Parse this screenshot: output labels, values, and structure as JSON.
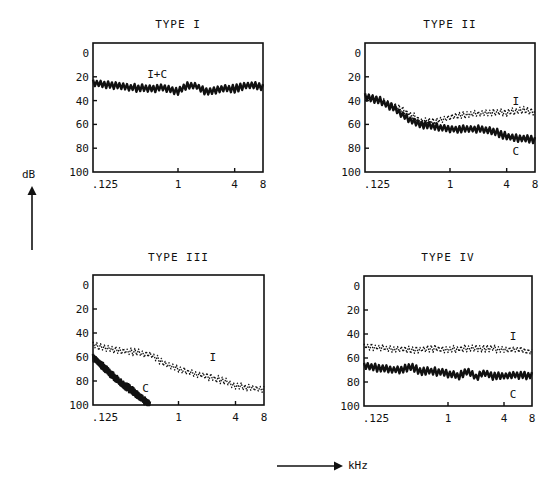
{
  "axis": {
    "y_unit": "dB",
    "x_unit": "kHz",
    "y_ticks": [
      "0",
      "20",
      "40",
      "60",
      "80",
      "100"
    ],
    "x_ticks": [
      ".125",
      "1",
      "4",
      "8"
    ]
  },
  "panels": [
    {
      "title": "TYPE I"
    },
    {
      "title": "TYPE II"
    },
    {
      "title": "TYPE III"
    },
    {
      "title": "TYPE IV"
    }
  ],
  "chart_data": [
    {
      "type": "line",
      "title": "TYPE I",
      "xlabel": "kHz",
      "ylabel": "dB",
      "x_scale": "log2",
      "x_ticks": [
        0.125,
        1,
        4,
        8
      ],
      "ylim": [
        100,
        0
      ],
      "y_ticks": [
        0,
        20,
        40,
        60,
        80,
        100
      ],
      "grid": false,
      "series": [
        {
          "name": "I+C",
          "style": "solid",
          "label_pos": {
            "x": 0.6,
            "y": 18
          },
          "x": [
            0.125,
            0.2,
            0.3,
            0.5,
            0.7,
            1.0,
            1.3,
            1.6,
            2.0,
            2.5,
            3.0,
            4.0,
            5.0,
            6.0,
            8.0
          ],
          "y": [
            25,
            27,
            29,
            30,
            29,
            32,
            27,
            28,
            33,
            31,
            30,
            30,
            28,
            27,
            28
          ]
        }
      ]
    },
    {
      "type": "line",
      "title": "TYPE II",
      "xlabel": "kHz",
      "ylabel": "dB",
      "x_scale": "log2",
      "x_ticks": [
        0.125,
        1,
        4,
        8
      ],
      "ylim": [
        100,
        0
      ],
      "y_ticks": [
        0,
        20,
        40,
        60,
        80,
        100
      ],
      "grid": false,
      "series": [
        {
          "name": "I",
          "style": "dotted",
          "label_pos": {
            "x": 5.0,
            "y": 40
          },
          "x": [
            0.125,
            0.18,
            0.25,
            0.35,
            0.5,
            0.7,
            1.0,
            1.5,
            2.0,
            3.0,
            4.0,
            6.0,
            8.0
          ],
          "y": [
            37,
            40,
            44,
            50,
            57,
            57,
            54,
            52,
            51,
            50,
            50,
            48,
            50
          ]
        },
        {
          "name": "C",
          "style": "solid",
          "label_pos": {
            "x": 5.0,
            "y": 82
          },
          "x": [
            0.125,
            0.18,
            0.25,
            0.35,
            0.5,
            0.7,
            1.0,
            1.5,
            2.0,
            3.0,
            4.0,
            6.0,
            8.0
          ],
          "y": [
            37,
            40,
            46,
            55,
            60,
            62,
            64,
            64,
            64,
            66,
            70,
            72,
            73
          ]
        }
      ]
    },
    {
      "type": "line",
      "title": "TYPE III",
      "xlabel": "kHz",
      "ylabel": "dB",
      "x_scale": "log2",
      "x_ticks": [
        0.125,
        1,
        4,
        8
      ],
      "ylim": [
        100,
        0
      ],
      "y_ticks": [
        0,
        20,
        40,
        60,
        80,
        100
      ],
      "grid": false,
      "series": [
        {
          "name": "I",
          "style": "dotted",
          "label_pos": {
            "x": 2.3,
            "y": 60
          },
          "x": [
            0.125,
            0.18,
            0.25,
            0.35,
            0.5,
            0.7,
            1.0,
            1.5,
            2.0,
            3.0,
            4.0,
            6.0,
            8.0
          ],
          "y": [
            50,
            53,
            55,
            56,
            58,
            65,
            70,
            74,
            76,
            80,
            84,
            86,
            87
          ]
        },
        {
          "name": "C",
          "style": "solid",
          "label_pos": {
            "x": 0.45,
            "y": 86
          },
          "x": [
            0.125,
            0.18,
            0.25,
            0.35,
            0.45,
            0.5
          ],
          "y": [
            60,
            72,
            82,
            90,
            97,
            100
          ]
        }
      ]
    },
    {
      "type": "line",
      "title": "TYPE IV",
      "xlabel": "kHz",
      "ylabel": "dB",
      "x_scale": "log2",
      "x_ticks": [
        0.125,
        1,
        4,
        8
      ],
      "ylim": [
        100,
        0
      ],
      "y_ticks": [
        0,
        20,
        40,
        60,
        80,
        100
      ],
      "grid": false,
      "series": [
        {
          "name": "I",
          "style": "dotted",
          "label_pos": {
            "x": 5.0,
            "y": 42
          },
          "x": [
            0.125,
            0.2,
            0.3,
            0.5,
            0.7,
            1.0,
            1.5,
            2.0,
            3.0,
            4.0,
            6.0,
            8.0
          ],
          "y": [
            50,
            52,
            53,
            53,
            52,
            53,
            52,
            52,
            52,
            53,
            53,
            55
          ]
        },
        {
          "name": "C",
          "style": "solid",
          "label_pos": {
            "x": 5.0,
            "y": 90
          },
          "x": [
            0.125,
            0.2,
            0.3,
            0.4,
            0.5,
            0.7,
            1.0,
            1.3,
            1.6,
            2.0,
            2.5,
            3.0,
            4.0,
            6.0,
            8.0
          ],
          "y": [
            66,
            69,
            70,
            67,
            71,
            71,
            73,
            75,
            71,
            76,
            72,
            75,
            75,
            74,
            75
          ]
        }
      ]
    }
  ]
}
